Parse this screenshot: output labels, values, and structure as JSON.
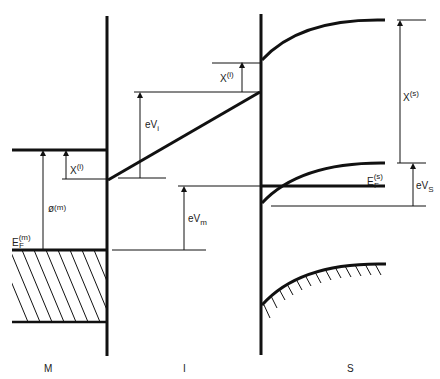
{
  "diagram": {
    "type": "MIS band diagram",
    "regions": {
      "metal": "M",
      "insulator": "I",
      "semiconductor": "S"
    },
    "labels": {
      "chi_i_left": {
        "base": "X",
        "sup": "(i)"
      },
      "phi_m": {
        "base": "ø",
        "sup": "(m)"
      },
      "ef_m": {
        "base": "E",
        "sub": "F",
        "sup": "(m)"
      },
      "eVi": {
        "base": "eV",
        "sub": "i"
      },
      "chi_i_right": {
        "base": "X",
        "sup": "(i)"
      },
      "eVm": {
        "base": "eV",
        "sub": "m"
      },
      "chi_s": {
        "base": "X",
        "sup": "(s)"
      },
      "ef_s": {
        "base": "E",
        "sub": "F",
        "sup": "(s)"
      },
      "eVs": {
        "base": "eV",
        "sub": "S"
      }
    },
    "colors": {
      "line": "#111111",
      "text": "#222222",
      "background": "#ffffff"
    }
  }
}
